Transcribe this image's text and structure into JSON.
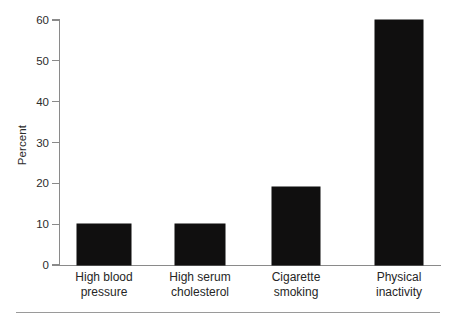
{
  "chart_data": {
    "type": "bar",
    "title": "",
    "xlabel": "",
    "ylabel": "Percent",
    "categories": [
      "High blood\npressure",
      "High serum\ncholesterol",
      "Cigarette\nsmoking",
      "Physical\ninactivity"
    ],
    "category_lines": [
      [
        "High blood",
        "pressure"
      ],
      [
        "High serum",
        "cholesterol"
      ],
      [
        "Cigarette",
        "smoking"
      ],
      [
        "Physical",
        "inactivity"
      ]
    ],
    "values": [
      10,
      10,
      19,
      60
    ],
    "ylim": [
      0,
      60
    ],
    "yticks": [
      0,
      10,
      20,
      30,
      40,
      50,
      60
    ],
    "ytick_labels": [
      "0",
      "10",
      "20",
      "30",
      "40",
      "50",
      "60"
    ],
    "grid": false,
    "legend": null,
    "bar_color": "#100f0f",
    "axis_color": "#8a8a8a",
    "background_color": "#ffffff"
  }
}
